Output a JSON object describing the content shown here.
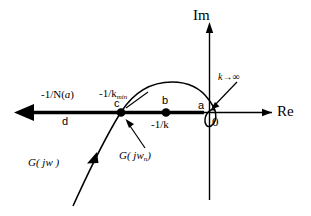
{
  "figure": {
    "axes": {
      "imaginary_label": "Im",
      "real_label": "Re",
      "origin_label": "0"
    },
    "points": [
      {
        "id": "a",
        "letter": "a",
        "desc": "intersection near origin",
        "x": 206,
        "y": 112
      },
      {
        "id": "b",
        "letter": "b",
        "label": "-1/k",
        "desc": "point b on negative real axis",
        "x": 166,
        "y": 112
      },
      {
        "id": "c",
        "letter": "c",
        "label": "-1/k",
        "label_sub": "min",
        "desc": "point c, tangency of G(jw) with -1/N(a) locus",
        "x": 121,
        "y": 112
      },
      {
        "id": "d",
        "letter": "d",
        "desc": "far end of describing function locus"
      }
    ],
    "labels": {
      "neg_inv_N": "-1/N(",
      "neg_inv_N_arg": "a",
      "neg_inv_N_close": ")",
      "neg_inv_kmin_main": "-1/k",
      "neg_inv_kmin_sub": "min",
      "neg_inv_k": "-1/k",
      "g_jw": "G( jw )",
      "g_jw_n": "G( jw",
      "g_jw_n_sub": "n",
      "g_jw_n_close": ")",
      "k_to_infinity_var": "k",
      "k_to_infinity_arrow": "→",
      "k_to_infinity_value": "∞"
    },
    "colors": {
      "ink": "#000000",
      "background": "#ffffff"
    }
  }
}
